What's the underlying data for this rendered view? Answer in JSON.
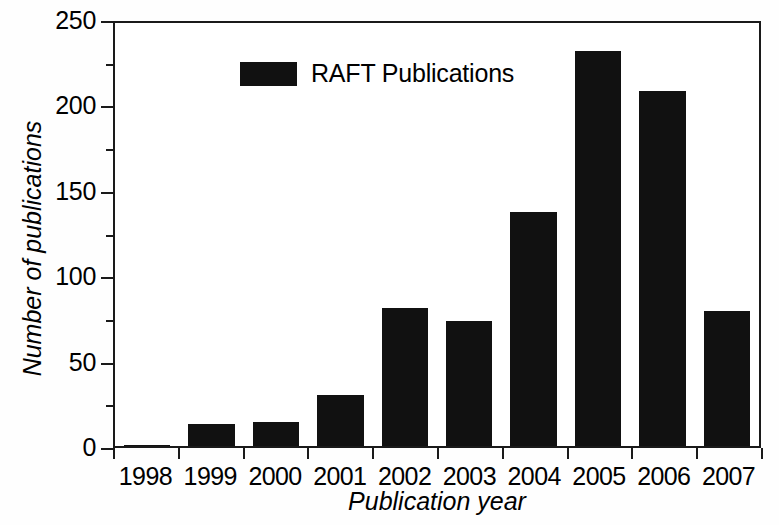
{
  "chart_data": {
    "type": "bar",
    "title": "",
    "xlabel": "Publication year",
    "ylabel": "Number of publications",
    "categories": [
      "1998",
      "1999",
      "2000",
      "2001",
      "2002",
      "2003",
      "2004",
      "2005",
      "2006",
      "2007"
    ],
    "values": [
      0,
      13,
      14,
      30,
      81,
      73,
      137,
      231,
      208,
      79
    ],
    "series": [
      {
        "name": "RAFT Publications",
        "color": "#111111",
        "values": [
          0,
          13,
          14,
          30,
          81,
          73,
          137,
          231,
          208,
          79
        ]
      }
    ],
    "ylim": [
      0,
      250
    ],
    "xlim_categories": true,
    "y_major_ticks": [
      0,
      50,
      100,
      150,
      200,
      250
    ],
    "y_minor_ticks": [
      25,
      75,
      125,
      175,
      225
    ],
    "y_tick_labels": [
      "0",
      "50",
      "100",
      "150",
      "200",
      "250"
    ],
    "grid": false,
    "legend": {
      "position": "top-left-inside",
      "entries": [
        {
          "label": "RAFT Publications",
          "color": "#111111",
          "marker": "filled-rectangle"
        }
      ]
    },
    "bar_color": "#111111",
    "background": "#ffffff",
    "frame": "full-box",
    "axis_color": "#1a1a1a",
    "axis_title_style": "italic"
  },
  "axes": {
    "y_title": "Number of publications",
    "x_title": "Publication year"
  },
  "legend": {
    "label": "RAFT Publications"
  }
}
